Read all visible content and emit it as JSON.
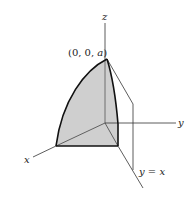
{
  "figure": {
    "axes": {
      "x_label": "x",
      "y_label": "y",
      "z_label": "z"
    },
    "apex_label": "(0, 0, a)",
    "apex_label_parts": {
      "prefix": "(0, 0, ",
      "var": "a",
      "suffix": ")"
    },
    "plane_label": "y = x",
    "colors": {
      "solid_fill": "#cfcfcf",
      "edge": "#111111",
      "axis": "#333333",
      "background": "#ffffff"
    }
  }
}
